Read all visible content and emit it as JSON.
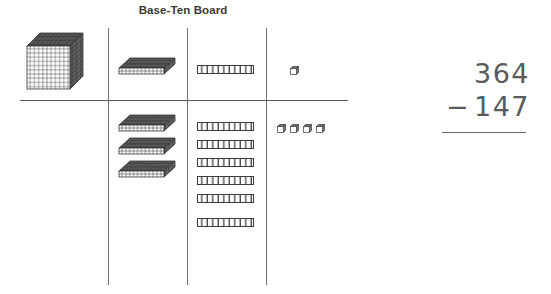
{
  "board": {
    "title": "Base-Ten Board",
    "columns": [
      {
        "name": "thousands",
        "piece": "cube"
      },
      {
        "name": "hundreds",
        "piece": "flat"
      },
      {
        "name": "tens",
        "piece": "rod"
      },
      {
        "name": "ones",
        "piece": "unit"
      }
    ],
    "top_row": {
      "label": "key-row",
      "thousands_count": 1,
      "hundreds_count": 1,
      "tens_count": 1,
      "ones_count": 1
    },
    "bottom_row": {
      "label": "quantity-row",
      "thousands_count": 0,
      "hundreds_count": 3,
      "tens_count": 6,
      "ones_count": 4
    }
  },
  "problem": {
    "minuend": "364",
    "operator": "−",
    "subtrahend": "147"
  },
  "colors": {
    "line": "#6d6d6d",
    "piece_dark": "#4a4a4a",
    "piece_light": "#f2f2f2",
    "text": "#3a3a3a",
    "problem_text": "#5b5b5b",
    "background": "#ffffff"
  }
}
